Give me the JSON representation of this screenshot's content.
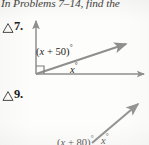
{
  "page": {
    "instruction": "In Problems 7–14, find the",
    "ink_color": "#2a2724",
    "ray_color": "#8a8a8a",
    "paper_color": "#fdfdfc"
  },
  "problems": [
    {
      "number": "7.",
      "marker_icon": "triangle-outline-icon",
      "figure": {
        "name": "angle-diagram-7",
        "rays": [
          "vertical-up",
          "diagonal-up-right",
          "horizontal-right"
        ],
        "right_angle_marker": true,
        "labels": [
          {
            "text": "(x + 50)",
            "variable": "x",
            "degree": "°",
            "full": "(x + 50)°"
          },
          {
            "text": "x",
            "variable": "x",
            "degree": "°",
            "full": "x°"
          }
        ]
      }
    },
    {
      "number": "9.",
      "marker_icon": "triangle-outline-icon",
      "figure": {
        "name": "angle-diagram-9",
        "rays": [
          "diagonal-up-right"
        ],
        "right_angle_marker": false,
        "clipped": true,
        "labels": [
          {
            "text": "(x + 80)",
            "variable": "x",
            "degree": "°",
            "full": "(x + 80)°"
          },
          {
            "text": "x",
            "variable": "x",
            "degree": "°",
            "full": "x°"
          }
        ]
      }
    }
  ]
}
